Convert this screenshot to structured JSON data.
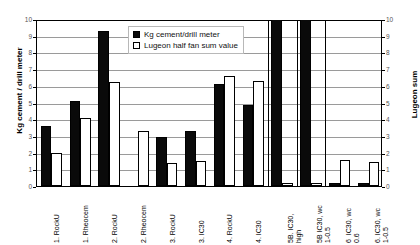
{
  "chart_data": {
    "type": "bar",
    "title": "",
    "xlabel": "",
    "ylabel": "Kg cement / drill meter",
    "y2label": "Lugeon sum",
    "ylim": [
      0,
      10
    ],
    "y2lim": [
      0,
      10
    ],
    "grid": true,
    "legend_position": "top-center",
    "y_ticks": [
      "0",
      "1",
      "2",
      "3",
      "4",
      "5",
      "6",
      "7",
      "8",
      "9",
      "10"
    ],
    "y2_ticks": [
      "0",
      "1",
      "2",
      "3",
      "4",
      "5",
      "6",
      "7",
      "8",
      "9",
      "10"
    ],
    "categories": [
      "1. RockU",
      "1. Rheocem",
      "2. RockU",
      "2. Rheocem",
      "3. RockU",
      "3. IC30",
      "4. RockU",
      "4. IC30",
      "5B. IC30,\nhigh",
      "5B IC30, wc\n1-0.5",
      "6  IC30, wc\n0.6",
      "6. IC30, wc\n1-0.5"
    ],
    "series": [
      {
        "name": "Kg cement/drill meter",
        "color": "#0a0a0a",
        "values": [
          3.6,
          5.1,
          9.3,
          0.0,
          2.95,
          3.3,
          6.1,
          4.85,
          10.4,
          10.4,
          0.2,
          0.2
        ]
      },
      {
        "name": "Lugeon half fan sum value",
        "color": "#ffffff",
        "values": [
          2.0,
          4.1,
          6.2,
          3.3,
          1.35,
          1.5,
          6.6,
          6.3,
          0.2,
          0.2,
          1.55,
          1.45
        ]
      }
    ],
    "section_dividers_after": [
      7,
      8,
      9
    ]
  },
  "legend": {
    "items": [
      {
        "label": "Kg cement/drill meter",
        "swatch": "black"
      },
      {
        "label": "Lugeon half fan sum value",
        "swatch": "white"
      }
    ]
  },
  "axes": {
    "left_title": "Kg cement / drill meter",
    "right_title": "Lugeon sum"
  }
}
